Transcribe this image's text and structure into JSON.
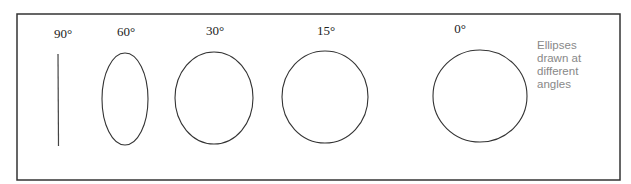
{
  "figure": {
    "title": "Ellipses drawn at different angles",
    "note_lines": [
      "Ellipses",
      "drawn at",
      "different",
      "angles"
    ],
    "items": [
      {
        "label": "90°",
        "angle_deg": 90,
        "shape": "line"
      },
      {
        "label": "60°",
        "angle_deg": 60,
        "shape": "ellipse"
      },
      {
        "label": "30°",
        "angle_deg": 30,
        "shape": "ellipse"
      },
      {
        "label": "15°",
        "angle_deg": 15,
        "shape": "ellipse"
      },
      {
        "label": "0°",
        "angle_deg": 0,
        "shape": "ellipse"
      }
    ]
  }
}
